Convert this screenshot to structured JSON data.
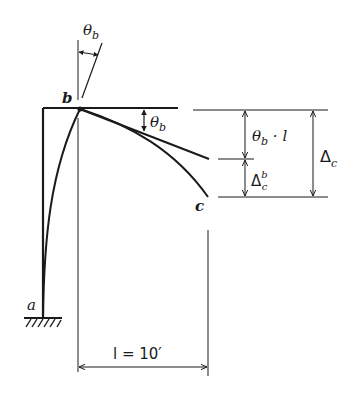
{
  "diagram": {
    "nodes": {
      "a": "a",
      "b": "b",
      "c": "c"
    },
    "labels": {
      "theta_top": "θ",
      "theta_top_sub": "b",
      "theta_beam": "θ",
      "theta_beam_sub": "b",
      "theta_l_theta": "θ",
      "theta_l_sub": "b",
      "theta_l_rest": " · l",
      "delta_cb": "Δ",
      "delta_cb_sup": "b",
      "delta_cb_sub": "c",
      "delta_c": "Δ",
      "delta_c_sub": "c",
      "span": "l = 10′"
    },
    "colors": {
      "ink": "#1a1a1a",
      "background": "#ffffff"
    }
  }
}
